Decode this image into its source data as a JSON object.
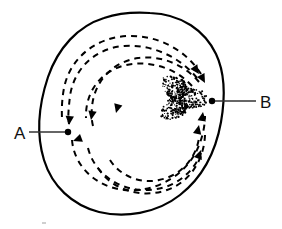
{
  "figure": {
    "background_color": "#ffffff",
    "ink_color": "#000000",
    "width": 282,
    "height": 229
  },
  "labels": {
    "a": {
      "text": "A",
      "x": 14,
      "y": 139,
      "leader_from_x": 29,
      "leader_from_y": 132,
      "leader_to_x": 68,
      "leader_to_y": 132,
      "marker_x": 68,
      "marker_y": 132,
      "marker_radius": 3.2
    },
    "b": {
      "text": "B",
      "x": 260,
      "y": 108,
      "leader_from_x": 256,
      "leader_from_y": 101,
      "leader_to_x": 212,
      "leader_to_y": 101,
      "marker_x": 212,
      "marker_y": 101,
      "marker_radius": 3.2
    }
  },
  "outline": {
    "name": "closed-irregular-contour",
    "stroke_width": 2.2,
    "path": "M 150 13 C 182 14 205 31 216 54 C 226 75 225 99 221 122 C 216 150 203 177 180 195 C 156 214 124 218 99 212 C 72 205 52 186 44 160 C 36 134 39 104 48 77 C 58 48 78 26 104 18 C 119 13 135 12 150 13 Z"
  },
  "stipple_blob": {
    "name": "stippled-core-region",
    "center_x": 180,
    "center_y": 98,
    "radius_x": 23,
    "radius_y": 25,
    "dot_count": 520,
    "dot_radius": 0.75
  },
  "spiral_arcs": [
    {
      "name": "outer-dashed-spiral",
      "path": "M 197 78 C 180 57 152 44 124 46 C 96 48 74 68 70 96 C 67 121 69 121 69 124",
      "dash": "6,5",
      "stroke_width": 2.0
    },
    {
      "name": "outer-dashed-spiral-lower",
      "path": "M 72 140 C 74 166 96 187 124 190 C 154 193 183 177 196 152 C 202 140 205 127 205 116",
      "dash": "6,5",
      "stroke_width": 2.0
    },
    {
      "name": "middle-dashed-spiral",
      "path": "M 201 74 C 186 50 158 35 128 36 C 96 37 70 58 64 88 C 61 104 62 116 62 120",
      "dash": "6,5",
      "stroke_width": 2.0
    },
    {
      "name": "middle-dashed-spiral-lower",
      "path": "M 88 148 C 94 172 116 189 143 190 C 170 191 192 176 201 153",
      "dash": "6,5",
      "stroke_width": 2.0
    },
    {
      "name": "inner-dashed-spiral",
      "path": "M 199 82 C 184 64 160 55 138 58 C 112 62 94 82 92 107 C 91 116 92 122 93 126",
      "dash": "6,5",
      "stroke_width": 2.0
    },
    {
      "name": "inner-dashed-spiral-lower",
      "path": "M 110 160 C 120 176 140 184 159 180 C 181 176 196 158 199 138",
      "dash": "6,5",
      "stroke_width": 2.0
    },
    {
      "name": "outermost-dashed-spiral-top",
      "path": "M 192 86 C 176 68 150 60 126 65 C 100 71 85 93 86 118",
      "dash": "6,5",
      "stroke_width": 2.0
    },
    {
      "name": "lower-sweep-dashed-spiral",
      "path": "M 98 168 C 112 190 141 199 167 190 C 190 182 204 160 205 135",
      "dash": "6,5",
      "stroke_width": 2.0
    }
  ],
  "arrowheads": [
    {
      "name": "arrowhead-left-outer-down",
      "x": 69,
      "y": 125,
      "rotation": 95
    },
    {
      "name": "arrowhead-left-middle-down",
      "x": 91,
      "y": 120,
      "rotation": 100
    },
    {
      "name": "arrowhead-left-inner-down",
      "x": 116,
      "y": 113,
      "rotation": 105
    },
    {
      "name": "arrowhead-a-below",
      "x": 73,
      "y": 141,
      "rotation": 160
    },
    {
      "name": "arrowhead-right-lower-up",
      "x": 201,
      "y": 150,
      "rotation": -70
    },
    {
      "name": "arrowhead-right-mid-up",
      "x": 199,
      "y": 125,
      "rotation": -78
    },
    {
      "name": "arrowhead-right-inner-up",
      "x": 203,
      "y": 112,
      "rotation": -82
    },
    {
      "name": "arrowhead-top-right-in",
      "x": 199,
      "y": 74,
      "rotation": 55
    },
    {
      "name": "arrowhead-top-right-in2",
      "x": 205,
      "y": 83,
      "rotation": 62
    }
  ],
  "artifact": {
    "name": "faint-corner-mark",
    "x": 42,
    "y": 222,
    "width": 4,
    "height": 2,
    "color": "#cfcfcf"
  }
}
